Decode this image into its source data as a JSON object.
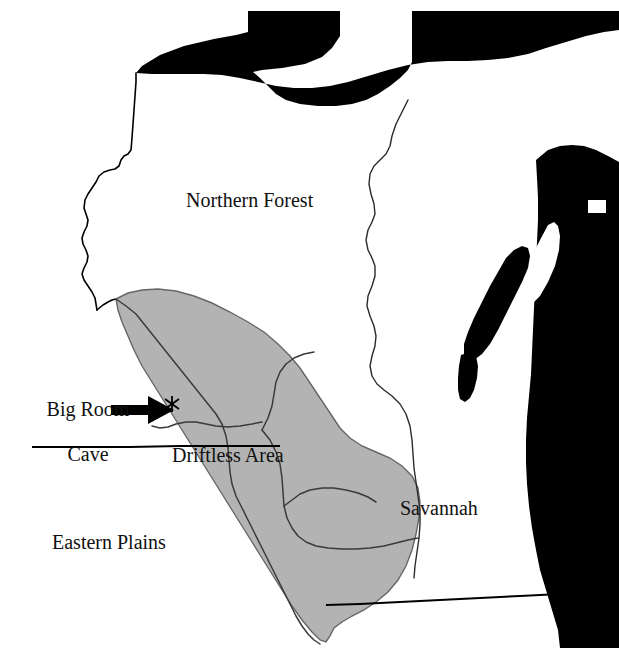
{
  "figure": {
    "kind": "scanned-map-figure",
    "background_color": "#ffffff",
    "outline_color": "#000000",
    "water_color": "#000000",
    "shaded_region_color": "#b3b3b3",
    "partial_caption_top": "",
    "width": 619,
    "height": 648
  },
  "labels": {
    "northern_forest": "Northern Forest",
    "driftless_area": "Driftless Area",
    "savannah": "Savannah",
    "eastern_plains": "Eastern Plains",
    "cave_line1": "Big Room",
    "cave_line2": "Cave"
  },
  "markers": {
    "cave_symbol": "*",
    "cave_symbol_name": "asterisk-site-marker",
    "pointer_name": "arrow-pointer-icon"
  },
  "regions": [
    {
      "name": "Northern Forest",
      "fill": "none",
      "label": "Northern Forest"
    },
    {
      "name": "Driftless Area",
      "fill": "#b3b3b3",
      "label": "Driftless Area"
    },
    {
      "name": "Eastern Plains",
      "fill": "none",
      "label": "Eastern Plains"
    },
    {
      "name": "Savannah",
      "fill": "none",
      "label": "Savannah"
    }
  ],
  "water_bodies": [
    {
      "name": "Lake Superior",
      "fill": "#000000"
    },
    {
      "name": "Lake Michigan",
      "fill": "#000000"
    },
    {
      "name": "Green Bay",
      "fill": "#ffffff"
    },
    {
      "name": "Door Peninsula",
      "fill": "#000000"
    }
  ]
}
